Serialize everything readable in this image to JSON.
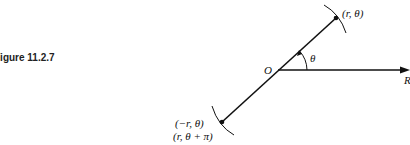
{
  "figure": {
    "label": "Figure 11.2.7"
  },
  "diagram": {
    "origin_label": "O",
    "axis_label": "R",
    "angle_label": "θ",
    "point_top_label": "(r, θ)",
    "point_bottom_label_1": "(−r, θ)",
    "point_bottom_label_2": "(r, θ + π)"
  }
}
